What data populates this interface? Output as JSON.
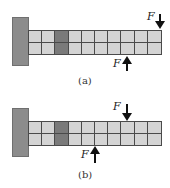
{
  "figures": [
    {
      "id": "a",
      "caption": "(a)",
      "wall": {
        "x": 12,
        "y": 17,
        "w": 17,
        "h": 49
      },
      "beam": {
        "x": 28,
        "y": 30,
        "cols": 10,
        "rows": 2,
        "dark_col": 2
      },
      "forces": [
        {
          "label": "F",
          "direction": "down",
          "x": 154,
          "y": 14,
          "len": 14,
          "label_x": 147,
          "label_y": 10
        },
        {
          "label": "F",
          "direction": "up",
          "x": 121,
          "y": 56,
          "len": 15,
          "label_x": 113,
          "label_y": 57
        }
      ],
      "caption_pos": {
        "x": 78,
        "y": 75
      }
    },
    {
      "id": "b",
      "caption": "(b)",
      "wall": {
        "x": 12,
        "y": 108,
        "w": 17,
        "h": 49
      },
      "beam": {
        "x": 28,
        "y": 121,
        "cols": 10,
        "rows": 2,
        "dark_col": 2
      },
      "forces": [
        {
          "label": "F",
          "direction": "down",
          "x": 121,
          "y": 104,
          "len": 16,
          "label_x": 113,
          "label_y": 100
        },
        {
          "label": "F",
          "direction": "up",
          "x": 89,
          "y": 146,
          "len": 17,
          "label_x": 81,
          "label_y": 148
        }
      ],
      "caption_pos": {
        "x": 78,
        "y": 169
      }
    }
  ],
  "colors": {
    "wall": "#8c8c8c",
    "cell": "#d4d4d4",
    "dark_cell": "#7a7a7a",
    "grid_line": "#4a4a4a",
    "arrow": "#111111"
  }
}
